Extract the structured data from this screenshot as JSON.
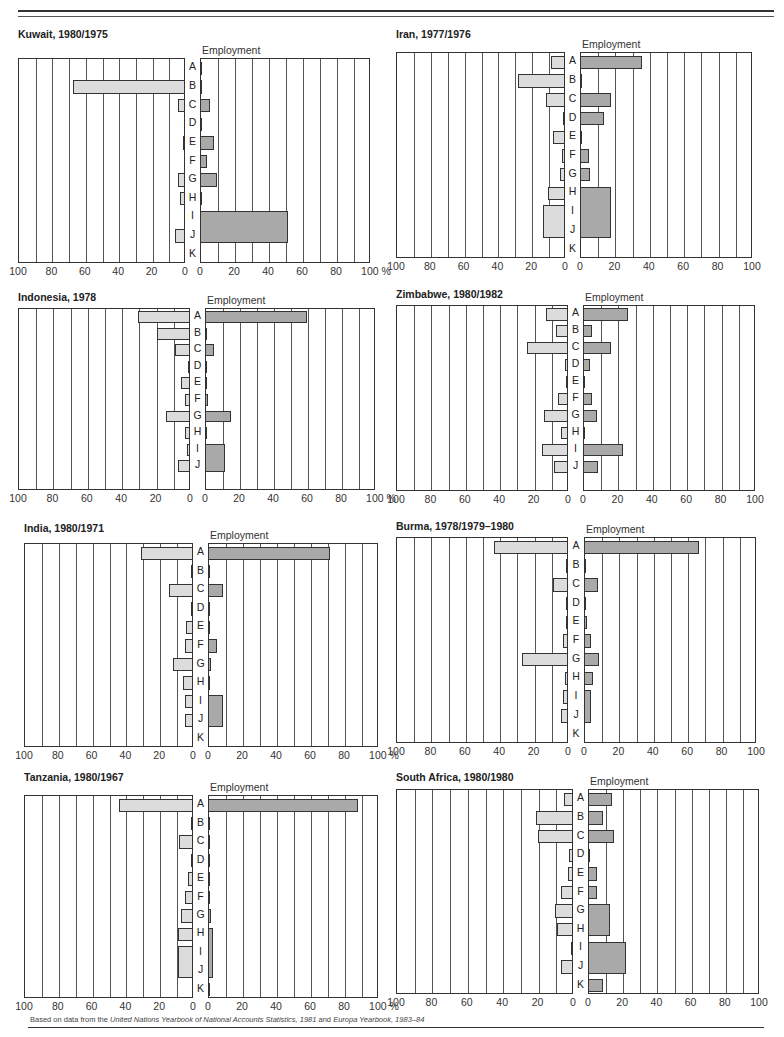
{
  "page": {
    "source_note_prefix": "Based on data from the ",
    "source_note_italic1": "United Nations Yearbook of National Accounts Statistics, 1981",
    "source_note_mid": " and ",
    "source_note_italic2": "Europa Yearbook, 1983–84"
  },
  "colors": {
    "industry_gdp_bar": "#dcdcdc",
    "employment_bar": "#a9a9a9",
    "outline": "#333333"
  },
  "chart_data": [
    {
      "type": "bar",
      "orientation": "horizontal-butterfly",
      "title": "Kuwait, 1980/1975",
      "left_label": "Industry/GDP",
      "right_label": "Employment",
      "categories": [
        "A",
        "B",
        "C",
        "D",
        "E",
        "F",
        "G",
        "H",
        "I",
        "J",
        "K"
      ],
      "series": [
        {
          "name": "Industry/GDP",
          "values": [
            0,
            67,
            4,
            0,
            1,
            0,
            4,
            3,
            0,
            6,
            0
          ]
        },
        {
          "name": "Employment",
          "values": [
            0.5,
            0.5,
            6,
            0.5,
            8,
            4,
            10,
            0.5,
            52,
            52,
            0
          ]
        }
      ],
      "merged_rows": {
        "Employment": [
          [
            "I",
            "J"
          ]
        ]
      },
      "xlim": [
        0,
        100
      ],
      "ticks": [
        100,
        80,
        60,
        40,
        20,
        0,
        0,
        20,
        40,
        60,
        80,
        "100 %"
      ],
      "grid": true
    },
    {
      "type": "bar",
      "orientation": "horizontal-butterfly",
      "title": "Iran, 1977/1976",
      "left_label": "Industry/GDP",
      "right_label": "Employment",
      "categories": [
        "A",
        "B",
        "C",
        "D",
        "E",
        "F",
        "G",
        "H",
        "I",
        "J",
        "K"
      ],
      "series": [
        {
          "name": "Industry/GDP",
          "values": [
            8,
            28,
            11,
            0.5,
            7,
            2,
            3,
            10,
            13,
            13,
            0
          ]
        },
        {
          "name": "Employment",
          "values": [
            36,
            0.5,
            18,
            14,
            0.5,
            5,
            6,
            18,
            18,
            18,
            0
          ]
        }
      ],
      "merged_rows": {
        "Industry/GDP": [
          [
            "I",
            "J"
          ]
        ],
        "Employment": [
          [
            "H",
            "I",
            "J"
          ]
        ]
      },
      "xlim": [
        0,
        100
      ],
      "ticks": [
        100,
        80,
        60,
        40,
        20,
        0,
        0,
        20,
        40,
        60,
        80,
        100
      ],
      "grid": true
    },
    {
      "type": "bar",
      "orientation": "horizontal-butterfly",
      "title": "Indonesia, 1978",
      "left_label": "Industry/GDP",
      "right_label": "Employment",
      "categories": [
        "A",
        "B",
        "C",
        "D",
        "E",
        "F",
        "G",
        "H",
        "I",
        "J"
      ],
      "series": [
        {
          "name": "Industry/GDP",
          "values": [
            30,
            19,
            9,
            0.5,
            5,
            3,
            14,
            3,
            2,
            7
          ]
        },
        {
          "name": "Employment",
          "values": [
            60,
            0.5,
            5,
            0.5,
            0.5,
            2,
            15,
            0.5,
            12,
            12
          ]
        }
      ],
      "merged_rows": {
        "Employment": [
          [
            "I",
            "J"
          ]
        ]
      },
      "xlim": [
        0,
        100
      ],
      "ticks": [
        100,
        80,
        60,
        40,
        20,
        0,
        0,
        20,
        40,
        60,
        80,
        "100 %"
      ],
      "grid": true
    },
    {
      "type": "bar",
      "orientation": "horizontal-butterfly",
      "title": "Zimbabwe, 1980/1982",
      "left_label": "Industry/GDP",
      "right_label": "Employment",
      "categories": [
        "A",
        "B",
        "C",
        "D",
        "E",
        "F",
        "G",
        "H",
        "I",
        "J"
      ],
      "series": [
        {
          "name": "Industry/GDP",
          "values": [
            13,
            7,
            24,
            2,
            1,
            6,
            14,
            4,
            15,
            8
          ]
        },
        {
          "name": "Employment",
          "values": [
            26,
            5,
            16,
            4,
            0.5,
            5,
            8,
            1,
            23,
            9
          ]
        }
      ],
      "merged_rows": {},
      "xlim": [
        0,
        100
      ],
      "ticks": [
        100,
        80,
        60,
        40,
        20,
        0,
        0,
        20,
        40,
        60,
        80,
        100
      ],
      "grid": true
    },
    {
      "type": "bar",
      "orientation": "horizontal-butterfly",
      "title": "India, 1980/1971",
      "left_label": "Industry/GDP",
      "right_label": "Employment",
      "categories": [
        "A",
        "B",
        "C",
        "D",
        "E",
        "F",
        "G",
        "H",
        "I",
        "J",
        "K"
      ],
      "series": [
        {
          "name": "Industry/GDP",
          "values": [
            31,
            1,
            14,
            1,
            4,
            5,
            12,
            6,
            5,
            5,
            0
          ]
        },
        {
          "name": "Employment",
          "values": [
            72,
            0.5,
            9,
            0.5,
            1,
            5,
            2,
            0.5,
            9,
            9,
            0
          ]
        }
      ],
      "merged_rows": {
        "Employment": [
          [
            "I",
            "J"
          ]
        ]
      },
      "xlim": [
        0,
        100
      ],
      "ticks": [
        100,
        80,
        60,
        40,
        20,
        0,
        0,
        20,
        40,
        60,
        80,
        "100 %"
      ],
      "grid": true
    },
    {
      "type": "bar",
      "orientation": "horizontal-butterfly",
      "title": "Burma, 1978/1979–1980",
      "left_label": "Industry/GDP",
      "right_label": "Employment",
      "categories": [
        "A",
        "B",
        "C",
        "D",
        "E",
        "F",
        "G",
        "H",
        "I",
        "J",
        "K"
      ],
      "series": [
        {
          "name": "Industry/GDP",
          "values": [
            43,
            1,
            9,
            1,
            1,
            3,
            27,
            2,
            3,
            4,
            0
          ]
        },
        {
          "name": "Employment",
          "values": [
            67,
            1,
            8,
            1,
            2,
            4,
            9,
            5,
            4,
            4,
            0
          ]
        }
      ],
      "merged_rows": {
        "Employment": [
          [
            "I",
            "J"
          ]
        ]
      },
      "xlim": [
        0,
        100
      ],
      "ticks": [
        "100",
        80,
        60,
        40,
        20,
        0,
        0,
        20,
        40,
        60,
        80,
        100
      ],
      "grid": true
    },
    {
      "type": "bar",
      "orientation": "horizontal-butterfly",
      "title": "Tanzania, 1980/1967",
      "left_label": "Industry/GDP",
      "right_label": "Employment",
      "categories": [
        "A",
        "B",
        "C",
        "D",
        "E",
        "F",
        "G",
        "H",
        "I",
        "J",
        "K"
      ],
      "series": [
        {
          "name": "Industry/GDP",
          "values": [
            44,
            1,
            8,
            0.5,
            3,
            5,
            7,
            9,
            9,
            9,
            0
          ]
        },
        {
          "name": "Employment",
          "values": [
            88,
            0.5,
            1,
            0.5,
            1,
            1,
            2,
            3,
            3,
            3,
            0.5
          ]
        }
      ],
      "merged_rows": {
        "Industry/GDP": [
          [
            "I",
            "J"
          ]
        ],
        "Employment": [
          [
            "H",
            "I",
            "J"
          ]
        ]
      },
      "xlim": [
        0,
        100
      ],
      "ticks": [
        100,
        80,
        60,
        40,
        20,
        0,
        0,
        20,
        40,
        60,
        80,
        "100 %"
      ],
      "grid": true
    },
    {
      "type": "bar",
      "orientation": "horizontal-butterfly",
      "title": "South Africa, 1980/1980",
      "left_label": "Industry/GDP",
      "right_label": "Employment",
      "categories": [
        "A",
        "B",
        "C",
        "D",
        "E",
        "F",
        "G",
        "H",
        "I",
        "J",
        "K"
      ],
      "series": [
        {
          "name": "Industry/GDP",
          "values": [
            5,
            21,
            20,
            2,
            3,
            7,
            10,
            9,
            1,
            7,
            0
          ]
        },
        {
          "name": "Employment",
          "values": [
            14,
            9,
            15,
            1,
            5,
            5,
            13,
            13,
            22,
            22,
            9
          ]
        }
      ],
      "merged_rows": {
        "Employment": [
          [
            "G",
            "H"
          ],
          [
            "I",
            "J"
          ]
        ]
      },
      "xlim": [
        0,
        100
      ],
      "ticks": [
        "100",
        80,
        60,
        40,
        20,
        0,
        0,
        20,
        40,
        60,
        80,
        100
      ],
      "grid": true
    }
  ]
}
